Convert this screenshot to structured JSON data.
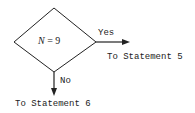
{
  "flowchart": {
    "decision": {
      "variable": "N",
      "operator": "=",
      "value": "9"
    },
    "branches": {
      "yes": {
        "label": "Yes",
        "target": "To Statement 5"
      },
      "no": {
        "label": "No",
        "target": "To Statement 6"
      }
    },
    "colors": {
      "line": "#222222",
      "background": "#ffffff"
    }
  }
}
